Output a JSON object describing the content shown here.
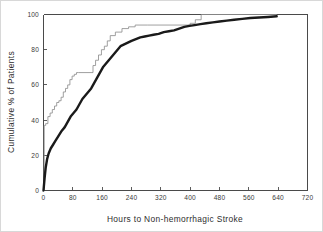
{
  "chart_data": {
    "type": "line",
    "title": "",
    "xlabel": "Hours to Non-hemorrhagic Stroke",
    "ylabel": "Cumulative % of Patients",
    "xlim": [
      0,
      720
    ],
    "ylim": [
      0,
      100
    ],
    "xticks": [
      0,
      80,
      160,
      240,
      320,
      400,
      480,
      560,
      640,
      720
    ],
    "yticks": [
      0,
      20,
      40,
      60,
      80,
      100
    ],
    "xtick_labels": [
      "0",
      "80",
      "160",
      "240",
      "320",
      "400",
      "480",
      "560",
      "640",
      "720"
    ],
    "ytick_labels": [
      "0",
      "20",
      "40",
      "60",
      "80",
      "100"
    ],
    "grid": false,
    "legend": "none",
    "series": [
      {
        "name": "thin-step-curve",
        "style": "step",
        "stroke": "#8f8f8f",
        "width": 0.85,
        "x": [
          0,
          2,
          2,
          6,
          6,
          12,
          12,
          18,
          18,
          24,
          24,
          30,
          30,
          36,
          36,
          42,
          42,
          48,
          48,
          54,
          54,
          60,
          60,
          66,
          66,
          72,
          72,
          78,
          78,
          84,
          84,
          90,
          90,
          96,
          96,
          135,
          135,
          142,
          142,
          150,
          150,
          158,
          158,
          166,
          166,
          174,
          174,
          182,
          182,
          196,
          196,
          214,
          214,
          232,
          232,
          250,
          250,
          284,
          284,
          400,
          400,
          414,
          414,
          430,
          430,
          636
        ],
        "y": [
          0,
          0,
          37,
          37,
          38,
          38,
          42,
          42,
          44,
          44,
          46,
          46,
          48,
          48,
          50,
          50,
          51,
          51,
          53,
          53,
          56,
          56,
          58,
          58,
          60,
          60,
          63,
          63,
          65,
          65,
          66,
          66,
          67,
          67,
          67,
          67,
          71,
          71,
          74,
          74,
          77,
          77,
          80,
          80,
          82,
          82,
          85,
          85,
          88,
          88,
          90,
          90,
          92,
          92,
          93,
          93,
          94,
          94,
          94,
          94,
          95,
          95,
          97,
          97,
          100,
          100
        ]
      },
      {
        "name": "thick-curve",
        "style": "smooth",
        "stroke": "#1a1a1a",
        "width": 2.4,
        "x": [
          0,
          3,
          6,
          10,
          14,
          20,
          26,
          32,
          38,
          44,
          50,
          58,
          66,
          74,
          82,
          90,
          98,
          106,
          114,
          122,
          130,
          138,
          146,
          154,
          162,
          170,
          178,
          186,
          194,
          202,
          210,
          220,
          230,
          240,
          252,
          264,
          276,
          288,
          300,
          314,
          328,
          342,
          356,
          370,
          384,
          398,
          412,
          428,
          444,
          462,
          480,
          500,
          520,
          542,
          564,
          588,
          612,
          636
        ],
        "y": [
          0,
          7,
          13,
          18,
          21,
          24,
          26,
          28,
          30,
          32,
          34,
          36,
          39,
          42,
          44,
          46,
          49,
          52,
          54,
          56,
          58,
          61,
          64,
          67,
          70,
          72,
          74,
          76,
          78,
          80,
          82,
          83,
          84,
          85,
          86,
          87,
          87.5,
          88,
          88.5,
          89,
          90,
          90.5,
          91,
          92,
          93,
          93.5,
          94,
          94.5,
          95,
          95.5,
          96,
          96.5,
          97,
          97.5,
          98,
          98.3,
          98.6,
          99
        ]
      }
    ]
  }
}
